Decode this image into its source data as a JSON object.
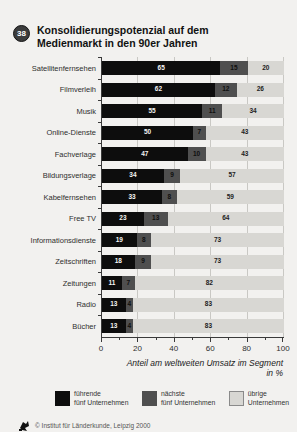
{
  "badge": "38",
  "title": {
    "line1": "Konsolidierungspotenzial auf dem",
    "line2": "Medienmarkt in den 90er Jahren"
  },
  "chart_data": {
    "type": "bar",
    "orientation": "horizontal",
    "stacked": true,
    "grid": "vertical, every 20",
    "categories": [
      "Satellitenfernsehen",
      "Filmverleih",
      "Musik",
      "Online-Dienste",
      "Fachverlage",
      "Bildungsverlage",
      "Kabelfernsehen",
      "Free TV",
      "Informationsdienste",
      "Zeitschriften",
      "Zeitungen",
      "Radio",
      "Bücher"
    ],
    "series": [
      {
        "name": "führende fünf Unternehmen",
        "color": "#0d0d0d",
        "values": [
          65,
          62,
          55,
          50,
          47,
          34,
          33,
          23,
          19,
          18,
          11,
          13,
          13
        ]
      },
      {
        "name": "nächste fünf Unternehmen",
        "color": "#4f4f4f",
        "values": [
          15,
          12,
          11,
          7,
          10,
          9,
          8,
          13,
          8,
          9,
          7,
          4,
          4
        ]
      },
      {
        "name": "übrige Unternehmen",
        "color": "#d8d7d3",
        "values": [
          20,
          26,
          34,
          43,
          43,
          57,
          59,
          64,
          73,
          73,
          82,
          83,
          83
        ]
      }
    ],
    "xlim": [
      0,
      100
    ],
    "xticks": [
      0,
      20,
      40,
      60,
      80,
      100
    ],
    "xlabel_line1": "Anteil am weltweiten Umsatz im Segment",
    "xlabel_line2": "in %",
    "legend_position": "bottom"
  },
  "legend": {
    "items": [
      {
        "color": "#0d0d0d",
        "border": "#0d0d0d",
        "label": "führende\nfünf Unternehmen"
      },
      {
        "color": "#4f4f4f",
        "border": "#4f4f4f",
        "label": "nächste\nfünf Unternehmen"
      },
      {
        "color": "#d8d7d3",
        "border": "#8a8a8a",
        "label": "übrige\nUnternehmen"
      }
    ]
  },
  "footer": {
    "credit": "© Institut für Länderkunde, Leipzig 2000"
  }
}
